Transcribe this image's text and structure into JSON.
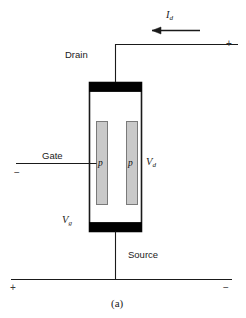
{
  "figure": {
    "caption": "(a)",
    "caption_letter": "a",
    "device_type": "JFET cross-section schematic"
  },
  "labels": {
    "drain": "Drain",
    "source": "Source",
    "gate": "Gate",
    "p_region_left": "p",
    "p_region_right": "p",
    "current_symbol": "I",
    "current_subscript": "d",
    "drain_voltage_symbol": "V",
    "drain_voltage_subscript": "d",
    "gate_voltage_symbol": "V",
    "gate_voltage_subscript": "g"
  },
  "polarity": {
    "drain_circuit_plus": "+",
    "gate_circuit_minus": "−",
    "source_circuit_plus": "+",
    "source_circuit_minus": "−"
  },
  "colors": {
    "line": "#1a1a1a",
    "contact_fill": "#000000",
    "p_region_fill": "#c9c9c9",
    "p_region_stroke": "#7a7a7a",
    "body_stroke": "#1a1a1a",
    "background": "#ffffff",
    "text": "#1a1a1a"
  },
  "geometry": {
    "body_x": 89,
    "body_y": 82,
    "body_width": 53,
    "body_height": 150,
    "contact_height": 9,
    "p_left_x": 96,
    "p_right_x": 127,
    "p_y": 121,
    "p_width": 11,
    "p_height": 83
  }
}
